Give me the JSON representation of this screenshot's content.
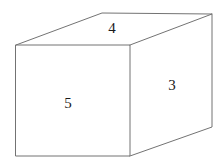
{
  "figure": {
    "type": "rectangular-prism-diagram",
    "canvas": {
      "width": 224,
      "height": 164,
      "background": "#ffffff"
    },
    "stroke_color": "#737373",
    "label_color": "#1a1a1a",
    "vertices": {
      "front_top_left": {
        "x": 16,
        "y": 45
      },
      "front_top_right": {
        "x": 130,
        "y": 45
      },
      "front_bottom_right": {
        "x": 130,
        "y": 156
      },
      "front_bottom_left": {
        "x": 16,
        "y": 156
      },
      "back_top_left": {
        "x": 102,
        "y": 13
      },
      "back_top_right": {
        "x": 212,
        "y": 14
      },
      "back_bottom_right": {
        "x": 212,
        "y": 127
      }
    },
    "labels": [
      {
        "id": "top-face-label",
        "text": "4",
        "x": 112,
        "y": 28,
        "face": "top"
      },
      {
        "id": "right-face-label",
        "text": "3",
        "x": 172,
        "y": 85,
        "face": "right"
      },
      {
        "id": "front-face-label",
        "text": "5",
        "x": 68,
        "y": 103,
        "face": "front"
      }
    ]
  }
}
